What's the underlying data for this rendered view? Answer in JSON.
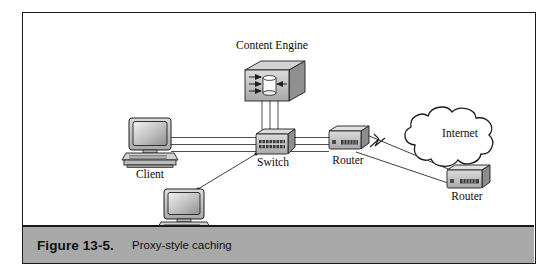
{
  "figure": {
    "caption_number": "Figure 13-5.",
    "caption_title": "Proxy-style caching"
  },
  "diagram": {
    "type": "network-topology",
    "nodes": [
      {
        "id": "content-engine",
        "label": "Content Engine",
        "icon": "content-engine-icon",
        "x": 248,
        "y": 72
      },
      {
        "id": "client",
        "label": "Client",
        "icon": "workstation-icon",
        "x": 127,
        "y": 133
      },
      {
        "id": "workstation-2",
        "label": "",
        "icon": "workstation-icon",
        "x": 162,
        "y": 197
      },
      {
        "id": "switch",
        "label": "Switch",
        "icon": "switch-icon",
        "x": 248,
        "y": 137
      },
      {
        "id": "router-local",
        "label": "Router",
        "icon": "router-icon",
        "x": 323,
        "y": 132
      },
      {
        "id": "internet-cloud",
        "label": "Internet",
        "icon": "cloud-icon",
        "x": 432,
        "y": 133
      },
      {
        "id": "router-remote",
        "label": "Router",
        "icon": "router-icon",
        "x": 444,
        "y": 171
      }
    ],
    "links": [
      {
        "from": "client",
        "to": "switch",
        "style": "triple-parallel"
      },
      {
        "from": "switch",
        "to": "content-engine",
        "style": "triple-parallel-vertical"
      },
      {
        "from": "switch",
        "to": "router-local",
        "style": "triple-parallel"
      },
      {
        "from": "workstation-2",
        "to": "switch",
        "style": "single"
      },
      {
        "from": "router-local",
        "to": "router-remote",
        "style": "serial-wan",
        "symbol": "lightning-icon"
      }
    ]
  },
  "colors": {
    "frame_border": "#1a1a1a",
    "caption_bar": "#a9a9a9",
    "device_fill": "#c9c9c9",
    "device_shadow": "#8a8a8a",
    "device_top": "#e2e2e2",
    "line": "#2a2a2a",
    "page_background": "#ffffff"
  }
}
